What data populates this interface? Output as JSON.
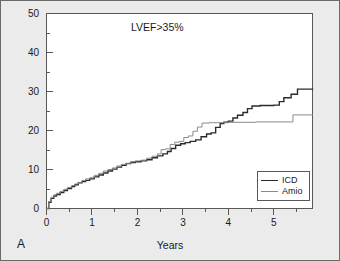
{
  "figure": {
    "panel_label": "A",
    "background_color": "#ebebeb",
    "plot_background_color": "#ffffff",
    "border_color": "#585858"
  },
  "legend": {
    "position": "bottom-right",
    "entries": [
      {
        "label": "ICD",
        "color": "#2b2b2b"
      },
      {
        "label": "Amio",
        "color": "#8a8a8a"
      }
    ]
  },
  "chart_data": {
    "type": "line",
    "subtype": "step-kaplan-meier",
    "title": "LVEF>35%",
    "xlabel": "Years",
    "ylabel": "",
    "xlim": [
      0,
      5.85
    ],
    "ylim": [
      0,
      50
    ],
    "grid": false,
    "x_major_ticks": [
      0,
      1,
      2,
      3,
      4,
      5
    ],
    "x_minor_ticks": [
      0.5,
      1.5,
      2.5,
      3.5,
      4.5,
      5.5
    ],
    "x_tick_labels": [
      "0",
      "1",
      "2",
      "3",
      "4",
      "5"
    ],
    "y_major_ticks": [
      0,
      10,
      20,
      30,
      40,
      50
    ],
    "y_minor_ticks": [
      5,
      15,
      25,
      35,
      45
    ],
    "y_tick_labels": [
      "0",
      "10",
      "20",
      "30",
      "40",
      "50"
    ],
    "legend_position": "lower right",
    "series": [
      {
        "name": "ICD",
        "color": "#2b2b2b",
        "width": 1.4,
        "final_value": 30.8,
        "points": [
          [
            0.0,
            0.0
          ],
          [
            0.05,
            1.6
          ],
          [
            0.1,
            2.6
          ],
          [
            0.16,
            3.2
          ],
          [
            0.22,
            3.6
          ],
          [
            0.3,
            4.1
          ],
          [
            0.38,
            4.6
          ],
          [
            0.46,
            5.1
          ],
          [
            0.55,
            5.6
          ],
          [
            0.62,
            6.1
          ],
          [
            0.7,
            6.6
          ],
          [
            0.78,
            6.9
          ],
          [
            0.86,
            7.2
          ],
          [
            0.95,
            7.6
          ],
          [
            1.05,
            8.1
          ],
          [
            1.15,
            8.6
          ],
          [
            1.25,
            9.1
          ],
          [
            1.35,
            9.6
          ],
          [
            1.45,
            10.1
          ],
          [
            1.55,
            10.6
          ],
          [
            1.65,
            11.1
          ],
          [
            1.75,
            11.5
          ],
          [
            1.85,
            11.8
          ],
          [
            1.95,
            12.0
          ],
          [
            2.08,
            12.2
          ],
          [
            2.2,
            12.5
          ],
          [
            2.32,
            13.0
          ],
          [
            2.44,
            13.5
          ],
          [
            2.56,
            14.0
          ],
          [
            2.66,
            14.6
          ],
          [
            2.74,
            15.4
          ],
          [
            2.84,
            16.2
          ],
          [
            2.95,
            16.6
          ],
          [
            3.05,
            16.9
          ],
          [
            3.16,
            17.2
          ],
          [
            3.28,
            17.6
          ],
          [
            3.4,
            18.4
          ],
          [
            3.52,
            19.1
          ],
          [
            3.62,
            19.4
          ],
          [
            3.72,
            20.8
          ],
          [
            3.82,
            21.8
          ],
          [
            3.9,
            22.1
          ],
          [
            4.0,
            22.4
          ],
          [
            4.1,
            23.2
          ],
          [
            4.2,
            23.9
          ],
          [
            4.32,
            24.6
          ],
          [
            4.42,
            25.6
          ],
          [
            4.52,
            26.3
          ],
          [
            4.7,
            26.4
          ],
          [
            5.0,
            26.5
          ],
          [
            5.12,
            27.4
          ],
          [
            5.22,
            28.4
          ],
          [
            5.38,
            29.3
          ],
          [
            5.52,
            30.6
          ],
          [
            5.85,
            30.8
          ]
        ]
      },
      {
        "name": "Amio",
        "color": "#8a8a8a",
        "width": 1.0,
        "final_value": 24.1,
        "points": [
          [
            0.0,
            0.0
          ],
          [
            0.05,
            1.8
          ],
          [
            0.1,
            2.9
          ],
          [
            0.16,
            3.5
          ],
          [
            0.22,
            3.9
          ],
          [
            0.3,
            4.4
          ],
          [
            0.38,
            4.9
          ],
          [
            0.46,
            5.4
          ],
          [
            0.55,
            5.9
          ],
          [
            0.62,
            6.3
          ],
          [
            0.7,
            6.7
          ],
          [
            0.78,
            7.2
          ],
          [
            0.86,
            7.6
          ],
          [
            0.95,
            7.9
          ],
          [
            1.05,
            8.5
          ],
          [
            1.15,
            9.0
          ],
          [
            1.25,
            9.6
          ],
          [
            1.35,
            10.0
          ],
          [
            1.45,
            10.4
          ],
          [
            1.55,
            10.9
          ],
          [
            1.65,
            11.3
          ],
          [
            1.75,
            11.6
          ],
          [
            1.85,
            12.0
          ],
          [
            1.95,
            12.2
          ],
          [
            2.08,
            12.4
          ],
          [
            2.2,
            12.9
          ],
          [
            2.32,
            13.4
          ],
          [
            2.44,
            14.0
          ],
          [
            2.52,
            15.1
          ],
          [
            2.62,
            15.3
          ],
          [
            2.72,
            16.4
          ],
          [
            2.82,
            17.0
          ],
          [
            2.92,
            17.2
          ],
          [
            3.02,
            18.2
          ],
          [
            3.12,
            18.6
          ],
          [
            3.22,
            19.8
          ],
          [
            3.32,
            20.9
          ],
          [
            3.42,
            21.9
          ],
          [
            3.58,
            22.0
          ],
          [
            4.0,
            22.1
          ],
          [
            4.6,
            22.2
          ],
          [
            5.35,
            22.2
          ],
          [
            5.42,
            24.0
          ],
          [
            5.85,
            24.1
          ]
        ]
      }
    ]
  }
}
